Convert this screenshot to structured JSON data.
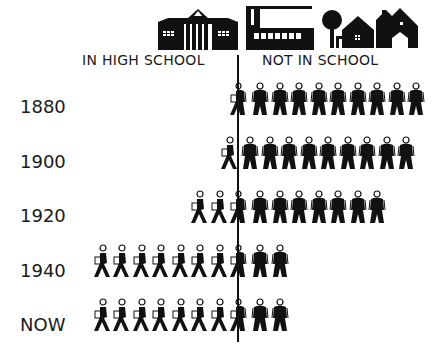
{
  "chart_data": {
    "type": "isotype",
    "title": "",
    "categories": [
      "1880",
      "1900",
      "1920",
      "1940",
      "NOW"
    ],
    "series": [
      {
        "name": "IN HIGH SCHOOL",
        "values": [
          0.5,
          1,
          2.5,
          7.5,
          7.5
        ]
      },
      {
        "name": "NOT IN SCHOOL",
        "values": [
          9.5,
          9,
          7.5,
          2.5,
          2.5
        ]
      }
    ],
    "unit": "each figure = 1/10 of age group",
    "total_per_row": 10,
    "header_icons": [
      "school-building",
      "factory",
      "tree",
      "house",
      "barn"
    ]
  },
  "headers": {
    "left": "IN HIGH SCHOOL",
    "right": "NOT IN SCHOOL"
  },
  "rows": [
    {
      "label": "1880"
    },
    {
      "label": "1900"
    },
    {
      "label": "1920"
    },
    {
      "label": "1940"
    },
    {
      "label": "NOW"
    }
  ],
  "colors": {
    "ink": "#111111",
    "background": "#ffffff"
  }
}
